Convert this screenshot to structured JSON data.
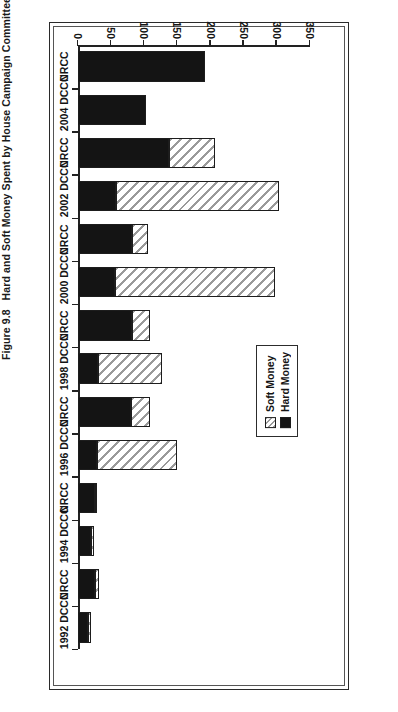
{
  "figure": {
    "number": "Figure 9.8",
    "title": "Hard and Soft Money Spent by House Campaign Committees, 1992–2004"
  },
  "legend": {
    "position": "inside-plot-left",
    "items": [
      {
        "label": "Soft Money",
        "swatch": "hatched"
      },
      {
        "label": "Hard Money",
        "swatch": "solid-black"
      }
    ]
  },
  "chart_data": {
    "type": "bar",
    "orientation": "horizontal",
    "stacked": true,
    "title": "Hard and Soft Money Spent by House Campaign Committees, 1992–2004",
    "xlabel": "",
    "ylabel": "$ Millions",
    "vlabel": "$ Millions",
    "axis_range": [
      0,
      350
    ],
    "axis_reversed": true,
    "tick_labels": [
      "350",
      "300",
      "250",
      "200",
      "150",
      "100",
      "50",
      "0"
    ],
    "tick_values": [
      350,
      300,
      250,
      200,
      150,
      100,
      50,
      0
    ],
    "grid": false,
    "categories": [
      "2004 NRCC",
      "2004 DCCC",
      "2002 NRCC",
      "2002 DCCC",
      "2000 NRCC",
      "2000 DCCC",
      "1998 NRCC",
      "1998 DCCC",
      "1996 NRCC",
      "1996 DCCC",
      "1994 NRCC",
      "1994 DCCC",
      "1992 NRCC",
      "1992 DCCC"
    ],
    "category_display_labels": [
      "NRCC",
      "2004 DCCC",
      "NRCC",
      "2002 DCCC",
      "NRCC",
      "2000 DCCC",
      "NRCC",
      "1998 DCCC",
      "NRCC",
      "1996 DCCC",
      "NRCC",
      "1994 DCCC",
      "NRCC",
      "1992 DCCC"
    ],
    "series": [
      {
        "name": "Hard Money",
        "color": "#141414",
        "values": [
          191,
          103,
          138,
          57,
          81,
          56,
          81,
          30,
          80,
          29,
          26,
          20,
          26,
          15
        ]
      },
      {
        "name": "Soft Money",
        "color": "#ffffff",
        "pattern": "diagonal-hatch",
        "values": [
          0,
          0,
          69,
          246,
          24,
          241,
          28,
          97,
          28,
          121,
          3,
          4,
          5,
          5
        ]
      }
    ],
    "totals": [
      191,
      103,
      207,
      303,
      105,
      297,
      109,
      127,
      108,
      150,
      29,
      24,
      31,
      20
    ]
  },
  "colors": {
    "hard_money": "#141414",
    "soft_money_fill": "#ffffff",
    "soft_money_hatch": "#9a9a9a",
    "axis": "#222222",
    "frame": "#2a2a2a",
    "background": "#ffffff"
  }
}
